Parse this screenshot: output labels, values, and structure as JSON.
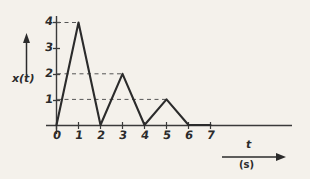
{
  "figure": {
    "kind": "signal-plot",
    "background_color": "#f4f1eb",
    "ink_color": "#2b2b2b",
    "grid_color": "#555555"
  },
  "axes": {
    "y_label": "x(t)",
    "x_label": "t",
    "x_unit": "(s)",
    "y_ticks": [
      "1",
      "2",
      "3",
      "4"
    ],
    "x_ticks": [
      "0",
      "1",
      "2",
      "3",
      "4",
      "5",
      "6",
      "7"
    ]
  },
  "chart_data": {
    "type": "line",
    "title": "",
    "xlabel": "t",
    "xunit": "(s)",
    "ylabel": "x(t)",
    "xlim": [
      0,
      7.6
    ],
    "ylim": [
      0,
      4.4
    ],
    "grid": false,
    "legend": "none",
    "x": [
      0,
      1,
      2,
      3,
      4,
      5,
      6,
      7
    ],
    "values": [
      0,
      4,
      0,
      2,
      0,
      1,
      0,
      0
    ],
    "series": [
      {
        "name": "x(t)",
        "points": [
          {
            "t": 0,
            "x": 0
          },
          {
            "t": 1,
            "x": 4
          },
          {
            "t": 2,
            "x": 0
          },
          {
            "t": 3,
            "x": 2
          },
          {
            "t": 4,
            "x": 0
          },
          {
            "t": 5,
            "x": 1
          },
          {
            "t": 6,
            "x": 0
          },
          {
            "t": 7,
            "x": 0
          }
        ]
      }
    ],
    "x_tick_values": [
      0,
      1,
      2,
      3,
      4,
      5,
      6,
      7
    ],
    "y_tick_values": [
      1,
      2,
      3,
      4
    ],
    "annotations": [
      {
        "type": "dashed-leader",
        "y": 4,
        "from_t": 0,
        "to_t": 1
      },
      {
        "type": "dashed-leader",
        "y": 2,
        "from_t": 0,
        "to_t": 3
      },
      {
        "type": "dashed-leader",
        "y": 1,
        "from_t": 0,
        "to_t": 5
      }
    ]
  }
}
